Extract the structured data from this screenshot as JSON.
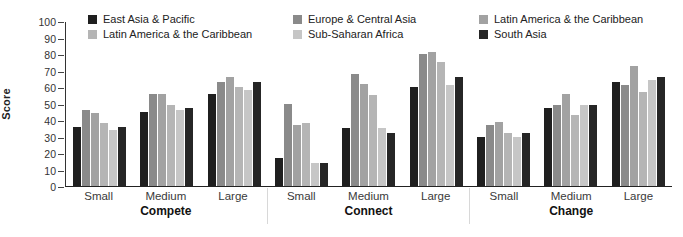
{
  "chart_data": {
    "type": "bar",
    "title": "",
    "ylabel": "Score",
    "ylim": [
      0,
      100
    ],
    "ytick_step": 10,
    "yticks": [
      100,
      90,
      80,
      70,
      60,
      50,
      40,
      30,
      20,
      10,
      0
    ],
    "grid": false,
    "legend_position": "top-inside",
    "panels": [
      "Compete",
      "Connect",
      "Change"
    ],
    "subgroups": [
      "Small",
      "Medium",
      "Large"
    ],
    "categories": [
      "Compete-Small",
      "Compete-Medium",
      "Compete-Large",
      "Connect-Small",
      "Connect-Medium",
      "Connect-Large",
      "Change-Small",
      "Change-Medium",
      "Change-Large"
    ],
    "series": [
      {
        "name": "East Asia & Pacific",
        "color": "#1f1f1f",
        "values": [
          36,
          45,
          56,
          17,
          35,
          60,
          30,
          47,
          63
        ]
      },
      {
        "name": "Europe & Central Asia",
        "color": "#8a8a8a",
        "values": [
          46,
          56,
          63,
          50,
          68,
          80,
          37,
          49,
          61
        ]
      },
      {
        "name": "Latin America & the Caribbean",
        "color": "#a2a2a2",
        "values": [
          44,
          56,
          66,
          37,
          62,
          81,
          39,
          56,
          73
        ]
      },
      {
        "name": "Latin America & the Caribbean",
        "color": "#b5b5b5",
        "values": [
          38,
          49,
          60,
          38,
          55,
          75,
          32,
          43,
          57
        ]
      },
      {
        "name": "Sub-Saharan Africa",
        "color": "#c6c6c6",
        "values": [
          34,
          46,
          58,
          14,
          35,
          61,
          30,
          49,
          64
        ]
      },
      {
        "name": "South Asia",
        "color": "#262626",
        "values": [
          36,
          47,
          63,
          14,
          32,
          66,
          32,
          49,
          66
        ]
      }
    ]
  }
}
